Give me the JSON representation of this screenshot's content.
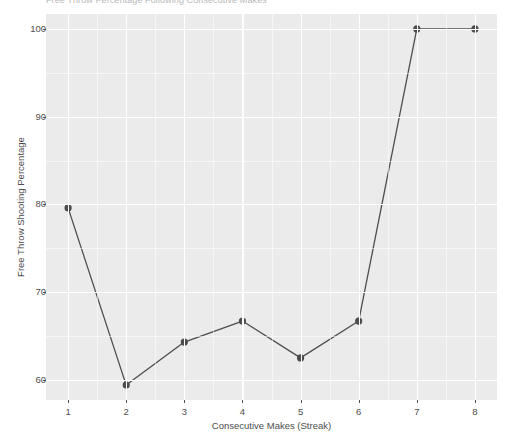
{
  "chart_data": {
    "type": "line",
    "title": "Free Throw Percentage Following Consecutive Makes",
    "xlabel": "Consecutive Makes (Streak)",
    "ylabel": "Free Throw Shooting Percentage",
    "x": [
      1,
      2,
      3,
      4,
      5,
      6,
      7,
      8
    ],
    "categories": [
      "1",
      "2",
      "3",
      "4",
      "5",
      "6",
      "7",
      "8"
    ],
    "values": [
      79.6,
      59.4,
      64.3,
      66.7,
      62.5,
      66.7,
      100.0,
      100.0
    ],
    "series": [
      {
        "name": "Free Throw Shooting Percentage",
        "values": [
          79.6,
          59.4,
          64.3,
          66.7,
          62.5,
          66.7,
          100.0,
          100.0
        ]
      }
    ],
    "xlim": [
      0.62,
      8.38
    ],
    "ylim": [
      57.7,
      101.7
    ],
    "xticks": [
      1,
      2,
      3,
      4,
      5,
      6,
      7,
      8
    ],
    "xtick_labels": [
      "1",
      "2",
      "3",
      "4",
      "5",
      "6",
      "7",
      "8"
    ],
    "yticks": [
      60,
      70,
      80,
      90,
      100
    ],
    "ytick_labels": [
      "60",
      "70",
      "80",
      "90",
      "100"
    ],
    "yticks_minor": [
      65,
      75,
      85,
      95
    ],
    "grid": true,
    "legend": null,
    "legend_position": "none",
    "marker": "circle",
    "marker_size": 3.6,
    "line_width": 1.3,
    "colors": {
      "line": "#4d4d4d",
      "point": "#4d4d4d",
      "panel_background": "#ebebeb",
      "gridline": "#ffffff",
      "plot_background": "#ffffff",
      "axis_text": "#4d4d4d",
      "title_text": "#b9b9b9"
    }
  }
}
